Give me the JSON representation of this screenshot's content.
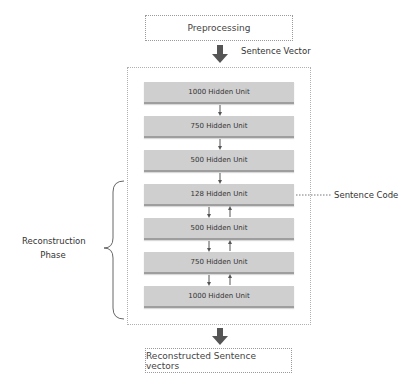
{
  "diagram": {
    "input_box": {
      "label": "Preprocessing"
    },
    "input_arrow_label": "Sentence Vector",
    "encoder_units": [
      {
        "label": "1000 Hidden Unit"
      },
      {
        "label": "750 Hidden Unit"
      },
      {
        "label": "500 Hidden Unit"
      }
    ],
    "code_unit": {
      "label": "128 Hidden Unit"
    },
    "code_annotation": "Sentence Code",
    "decoder_units": [
      {
        "label": "500 Hidden Unit"
      },
      {
        "label": "750 Hidden Unit"
      },
      {
        "label": "1000 Hidden Unit"
      }
    ],
    "brace_label_line1": "Reconstruction",
    "brace_label_line2": "Phase",
    "output_box": {
      "label": "Reconstructed Sentence vectors"
    },
    "colors": {
      "unit_fill": "#cfcfcf",
      "unit_shadow": "#9e9e9e",
      "arrow": "#555555",
      "border": "#9a9a9a"
    }
  }
}
